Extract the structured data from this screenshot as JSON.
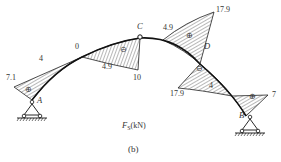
{
  "diagram": {
    "type": "shear-force diagram of three-hinged arch",
    "caption": "(b)",
    "unit_label": "F_S(kN)",
    "unit_label_main": "F",
    "unit_label_sub": "S",
    "unit_label_suffix": "(kN)",
    "points": {
      "A": "A",
      "B": "B",
      "C": "C",
      "D": "D"
    },
    "values": {
      "A_left": "7.1",
      "seg1": "4",
      "zero": "0",
      "neg_left": "4.9",
      "neg_peak": "10",
      "pos_right": "4.9",
      "pos_peak": "17.9",
      "D_neg": "17.9",
      "D_right": "4",
      "B_right": "7"
    },
    "signs": {
      "plus": "⊕",
      "minus": "⊖"
    },
    "colors": {
      "line": "#1a1a1a",
      "hatch": "#333333",
      "text": "#333333"
    }
  }
}
